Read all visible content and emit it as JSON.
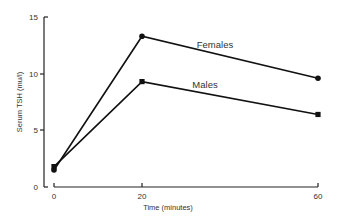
{
  "chart_data": {
    "type": "line",
    "title": "",
    "xlabel": "Time (minutes)",
    "ylabel": "Serum TSH (mu/l)",
    "x": [
      0,
      20,
      60
    ],
    "x_ticks": [
      "0",
      "20",
      "60"
    ],
    "y_ticks": [
      "0",
      "5",
      "10",
      "15"
    ],
    "ylim": [
      0,
      15
    ],
    "xlim": [
      0,
      60
    ],
    "grid": false,
    "series": [
      {
        "name": "Females",
        "marker": "circle",
        "values": [
          1.5,
          13.3,
          9.6
        ]
      },
      {
        "name": "Males",
        "marker": "square",
        "values": [
          1.8,
          9.3,
          6.4
        ]
      }
    ],
    "annotations": [
      {
        "text": "Females",
        "near_series": "Females"
      },
      {
        "text": "Males",
        "near_series": "Males"
      }
    ]
  }
}
